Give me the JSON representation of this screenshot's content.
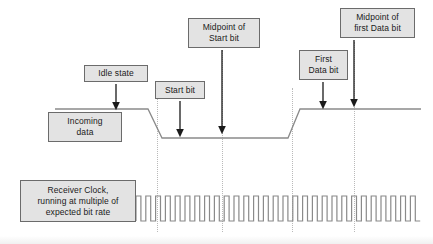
{
  "diagram": {
    "colors": {
      "box_fill": "#e3e3e3",
      "box_border": "#6b6b6b",
      "waveform": "#8a8a8a",
      "arrow": "#1a1a1a",
      "guide_line": "#b9b9b9",
      "background": "#ffffff"
    },
    "callouts": [
      {
        "id": "idle-state",
        "label": "Idle state",
        "x": 84,
        "y": 65,
        "w": 64,
        "h": 17
      },
      {
        "id": "start-bit",
        "label": "Start bit",
        "x": 155,
        "y": 81,
        "w": 50,
        "h": 18
      },
      {
        "id": "midpoint-start-bit",
        "label": "Midpoint of\nStart bit",
        "x": 188,
        "y": 18,
        "w": 72,
        "h": 30
      },
      {
        "id": "first-data-bit",
        "label": "First\nData bit",
        "x": 299,
        "y": 50,
        "w": 49,
        "h": 30
      },
      {
        "id": "midpoint-first-data-bit",
        "label": "Midpoint of\nfirst Data bit",
        "x": 340,
        "y": 8,
        "w": 75,
        "h": 30
      },
      {
        "id": "incoming-data",
        "label": "Incoming\ndata",
        "x": 48,
        "y": 112,
        "w": 74,
        "h": 30
      },
      {
        "id": "receiver-clock",
        "label": "Receiver Clock,\nrunning at multiple of\nexpected bit rate",
        "x": 20,
        "y": 180,
        "w": 116,
        "h": 42
      }
    ],
    "guide_lines": [
      {
        "id": "guide-start-bit-edge",
        "x": 157,
        "y_top": 88,
        "y_bottom": 232
      },
      {
        "id": "guide-midpoint-start-bit",
        "x": 222,
        "y_top": 50,
        "y_bottom": 232
      },
      {
        "id": "guide-first-data-bit-edge",
        "x": 292,
        "y_top": 88,
        "y_bottom": 232
      },
      {
        "id": "guide-midpoint-first-data-bit",
        "x": 354,
        "y_top": 42,
        "y_bottom": 232
      }
    ],
    "arrows": [
      {
        "id": "arrow-idle-state",
        "x": 116,
        "y_from": 84,
        "y_to": 107
      },
      {
        "id": "arrow-start-bit",
        "x": 180,
        "y_from": 101,
        "y_to": 134
      },
      {
        "id": "arrow-midpoint-start-bit",
        "x": 222,
        "y_from": 50,
        "y_to": 131
      },
      {
        "id": "arrow-first-data-bit",
        "x": 323,
        "y_from": 82,
        "y_to": 106
      },
      {
        "id": "arrow-midpoint-first-data-bit",
        "x": 354,
        "y_from": 40,
        "y_to": 104
      }
    ],
    "waveforms": {
      "incoming_data": {
        "name": "Incoming data signal",
        "level_high_y": 109,
        "level_low_y": 138,
        "points": "55,109 148,109 162,138 288,138 300,109 421,109",
        "description": "Idle high, falls at start bit, low through start bit, rises at first data bit"
      },
      "receiver_clock": {
        "name": "Receiver clock signal",
        "baseline_y": 221,
        "top_y": 196,
        "x_start": 136,
        "x_end": 421,
        "pulse_count": 29,
        "period_px": 9.8,
        "duty": 0.5
      }
    }
  }
}
